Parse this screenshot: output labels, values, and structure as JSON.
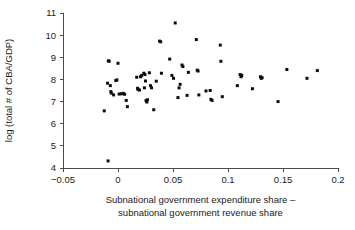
{
  "chart_data": {
    "type": "scatter",
    "title": "",
    "xlabel": "Subnational government expenditure share – subnational government revenue share",
    "xlabel_line1": "Subnational government expenditure share –",
    "xlabel_line2": "subnational government revenue share",
    "ylabel": "log (total # of CBA/GDP)",
    "xlim": [
      -0.05,
      0.2
    ],
    "ylim": [
      4,
      11
    ],
    "xticks": [
      -0.05,
      0,
      0.05,
      0.1,
      0.15,
      0.2
    ],
    "xtick_labels": [
      "−0.05",
      "0",
      "0.05",
      "0.1",
      "0.15",
      "0.2"
    ],
    "yticks": [
      4,
      5,
      6,
      7,
      8,
      9,
      10,
      11
    ],
    "ytick_labels": [
      "4",
      "5",
      "6",
      "7",
      "8",
      "9",
      "10",
      "11"
    ],
    "grid": false,
    "legend": null,
    "marker": "square",
    "marker_color": "#0d0d0d",
    "marker_size_px": 3,
    "n_points": 76,
    "points": [
      [
        -0.0125,
        6.58
      ],
      [
        -0.0095,
        7.83
      ],
      [
        -0.009,
        4.32
      ],
      [
        -0.0088,
        8.84
      ],
      [
        -0.008,
        8.82
      ],
      [
        -0.007,
        7.72
      ],
      [
        -0.0065,
        7.45
      ],
      [
        -0.006,
        7.38
      ],
      [
        -0.004,
        7.3
      ],
      [
        -0.002,
        7.95
      ],
      [
        -0.001,
        7.98
      ],
      [
        0.0,
        8.73
      ],
      [
        0.001,
        7.34
      ],
      [
        0.003,
        7.35
      ],
      [
        0.0048,
        7.37
      ],
      [
        0.006,
        7.33
      ],
      [
        0.0075,
        7.05
      ],
      [
        0.0085,
        6.77
      ],
      [
        0.017,
        8.1
      ],
      [
        0.0178,
        7.6
      ],
      [
        0.0182,
        7.55
      ],
      [
        0.0195,
        7.52
      ],
      [
        0.0205,
        8.12
      ],
      [
        0.0215,
        8.18
      ],
      [
        0.0235,
        8.28
      ],
      [
        0.024,
        7.62
      ],
      [
        0.0245,
        8.22
      ],
      [
        0.025,
        7.93
      ],
      [
        0.0255,
        7.05
      ],
      [
        0.0262,
        6.98
      ],
      [
        0.0268,
        7.08
      ],
      [
        0.0285,
        8.3
      ],
      [
        0.0295,
        7.72
      ],
      [
        0.0305,
        7.62
      ],
      [
        0.0325,
        6.63
      ],
      [
        0.0348,
        7.92
      ],
      [
        0.0378,
        9.73
      ],
      [
        0.0388,
        9.7
      ],
      [
        0.0395,
        8.28
      ],
      [
        0.047,
        8.92
      ],
      [
        0.049,
        8.18
      ],
      [
        0.0505,
        8.05
      ],
      [
        0.052,
        10.55
      ],
      [
        0.0545,
        7.18
      ],
      [
        0.0555,
        7.62
      ],
      [
        0.0565,
        7.78
      ],
      [
        0.0582,
        8.65
      ],
      [
        0.059,
        8.58
      ],
      [
        0.0628,
        7.28
      ],
      [
        0.064,
        8.32
      ],
      [
        0.0712,
        9.8
      ],
      [
        0.072,
        8.42
      ],
      [
        0.0728,
        8.38
      ],
      [
        0.0735,
        7.3
      ],
      [
        0.08,
        7.48
      ],
      [
        0.0838,
        7.5
      ],
      [
        0.0845,
        7.1
      ],
      [
        0.0855,
        7.05
      ],
      [
        0.093,
        9.55
      ],
      [
        0.0935,
        8.82
      ],
      [
        0.0948,
        7.22
      ],
      [
        0.1085,
        7.72
      ],
      [
        0.111,
        8.22
      ],
      [
        0.1118,
        8.12
      ],
      [
        0.1125,
        8.18
      ],
      [
        0.1222,
        7.58
      ],
      [
        0.1295,
        8.12
      ],
      [
        0.1302,
        8.05
      ],
      [
        0.131,
        8.08
      ],
      [
        0.1455,
        7.0
      ],
      [
        0.1535,
        8.45
      ],
      [
        0.1718,
        8.05
      ],
      [
        0.1812,
        8.4
      ]
    ]
  }
}
